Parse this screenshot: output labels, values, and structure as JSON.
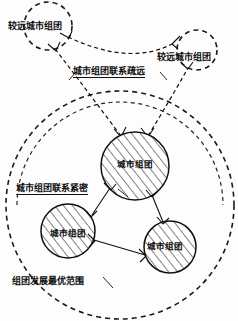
{
  "diagram": {
    "clusters": [
      {
        "id": "core-top",
        "label": "城市组团",
        "cx": 135,
        "cy": 166,
        "r": 34
      },
      {
        "id": "core-left",
        "label": "城市组团",
        "cx": 68,
        "cy": 231,
        "r": 27
      },
      {
        "id": "core-right",
        "label": "城市组团",
        "cx": 170,
        "cy": 247,
        "r": 26
      }
    ],
    "remote_clusters": [
      {
        "id": "remote-left",
        "label": "较远城市组团",
        "cx": 48,
        "cy": 26,
        "r": 24
      },
      {
        "id": "remote-right",
        "label": "较远城市组团",
        "cx": 197,
        "cy": 50,
        "r": 20
      }
    ],
    "annotations": {
      "sparse_links": "城市组团联系疏远",
      "tight_links": "城市组团联系紧密",
      "optimal_range": "组团发展最优范围"
    },
    "boundaries": [
      {
        "id": "outer-optimal-range",
        "cx": 120,
        "cy": 205,
        "r": 114,
        "style": "dashed"
      },
      {
        "id": "inner-optimal-range",
        "cx": 120,
        "cy": 205,
        "r": 103,
        "style": "dashed"
      }
    ],
    "colors": {
      "ink": "#111111",
      "paper": "#fdfdfd",
      "hatch": "#1a1a1a"
    }
  }
}
